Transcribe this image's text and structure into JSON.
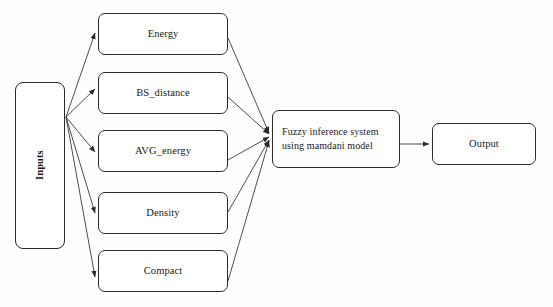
{
  "diagram": {
    "colors": {
      "background": "#fefefe",
      "node_border": "#2b2b2b",
      "node_fill": "#ffffff",
      "edge": "#3a3a3a",
      "text": "#1a1a1a"
    },
    "nodes": {
      "inputs": {
        "label": "Inputs",
        "orientation": "vertical"
      },
      "energy": {
        "label": "Energy"
      },
      "bs_distance": {
        "label": "BS_distance"
      },
      "avg_energy": {
        "label": "AVG_energy"
      },
      "density": {
        "label": "Density"
      },
      "compact": {
        "label": "Compact"
      },
      "fuzzy": {
        "label": "Fuzzy inference system\nusing mamdani model"
      },
      "output": {
        "label": "Output"
      }
    },
    "edges": [
      {
        "from": "inputs",
        "to": "energy",
        "arrow": true
      },
      {
        "from": "inputs",
        "to": "bs_distance",
        "arrow": true
      },
      {
        "from": "inputs",
        "to": "avg_energy",
        "arrow": true
      },
      {
        "from": "inputs",
        "to": "density",
        "arrow": true
      },
      {
        "from": "inputs",
        "to": "compact",
        "arrow": true
      },
      {
        "from": "energy",
        "to": "fuzzy",
        "arrow": true
      },
      {
        "from": "bs_distance",
        "to": "fuzzy",
        "arrow": true
      },
      {
        "from": "avg_energy",
        "to": "fuzzy",
        "arrow": true
      },
      {
        "from": "density",
        "to": "fuzzy",
        "arrow": true
      },
      {
        "from": "compact",
        "to": "fuzzy",
        "arrow": true
      },
      {
        "from": "fuzzy",
        "to": "output",
        "arrow": true
      }
    ]
  }
}
